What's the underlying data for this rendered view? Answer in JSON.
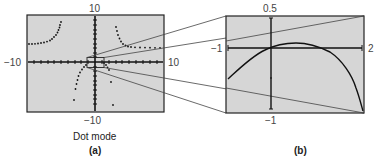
{
  "panel_a": {
    "ymax_label": "10",
    "ymin_label": "−10",
    "xmin_label": "−10",
    "xmax_label": "10",
    "mode_label": "Dot mode",
    "caption": "(a)"
  },
  "panel_b": {
    "ymax_label": "0.5",
    "ymin_label": "−1",
    "xmin_label": "−1",
    "xmax_label": "2",
    "caption": "(b)"
  },
  "colors": {
    "screen_bg": "#d6d6d6",
    "frame": "#222222",
    "curve": "#1a1a1a",
    "zoom_lines": "#444444"
  }
}
